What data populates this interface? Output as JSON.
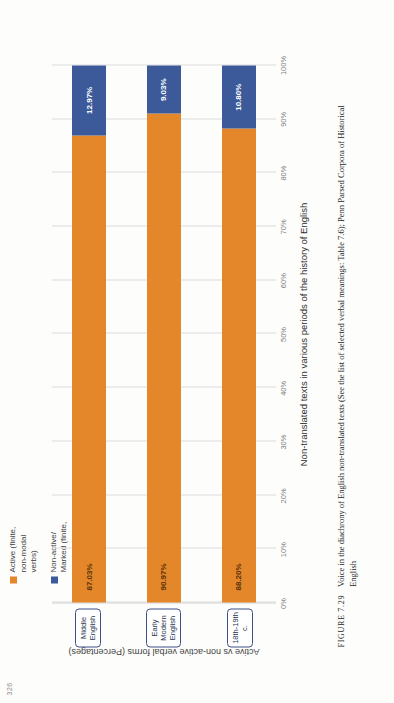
{
  "page": {
    "number": "326"
  },
  "legend": {
    "items": [
      {
        "label": "Active (finite,\nnon-modal\nverbs)",
        "color": "#e3872a",
        "swatch_name": "legend-swatch-active"
      },
      {
        "label": "Non-active/\nMarked (finite,\nnon-modal\nverbs)",
        "color": "#3c5a9a",
        "swatch_name": "legend-swatch-nonactive"
      }
    ]
  },
  "axis": {
    "y_title": "Active vs non-active verbal forms (Percentages)",
    "x_title": "Non-translated texts in various periods of the history of English",
    "ticks": [
      "0%",
      "10%",
      "20%",
      "30%",
      "40%",
      "50%",
      "60%",
      "70%",
      "80%",
      "90%",
      "100%"
    ]
  },
  "figure": {
    "number": "FIGURE 7.29",
    "caption": "Voice in the diachrony of English non-translated texts (See the list of selected verbal meanings: Table 7.6); Penn Parsed Corpora of Historical English"
  },
  "chart_data": {
    "type": "bar",
    "title": "",
    "subtype": "stacked-horizontal-100",
    "categories": [
      "Middle English",
      "Early Modern English",
      "18th-19th c."
    ],
    "series": [
      {
        "name": "Active (finite, non-modal verbs)",
        "color": "#e3872a",
        "values": [
          87.03,
          90.97,
          88.2
        ],
        "labels": [
          "87.03%",
          "90.97%",
          "88.20%"
        ]
      },
      {
        "name": "Non-active/Marked (finite, non-modal verbs)",
        "color": "#3c5a9a",
        "values": [
          12.97,
          9.03,
          10.8
        ],
        "labels": [
          "12.97%",
          "9.03%",
          "10.80%"
        ]
      }
    ],
    "xlabel": "Non-translated texts in various periods of the history of English",
    "ylabel": "Active vs non-active verbal forms (Percentages)",
    "xlim": [
      0,
      100
    ],
    "grid": true,
    "legend_position": "top"
  }
}
